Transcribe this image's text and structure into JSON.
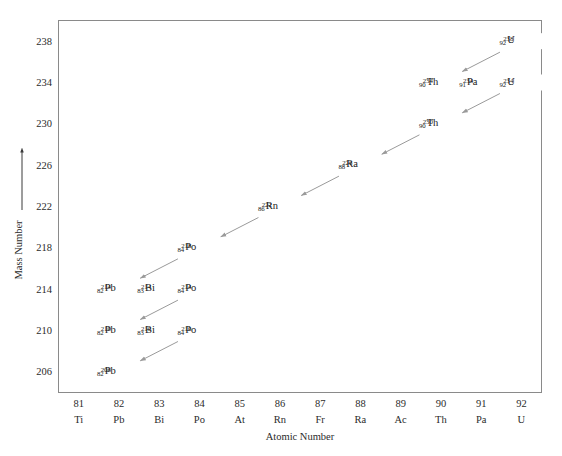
{
  "figure": {
    "title": "",
    "background_color": "#ffffff"
  },
  "axes": {
    "x_title": "Atomic Number",
    "y_title": "Mass Number",
    "y_axis_arrow": "up-arrow",
    "grid": "on",
    "grid_color": "#e3e3e3",
    "frame_color": "#8a8a8a"
  },
  "chart_data": {
    "type": "scatter",
    "title": "",
    "xlabel": "Atomic Number",
    "ylabel": "Mass Number",
    "xlim": [
      80.5,
      92.5
    ],
    "ylim": [
      204,
      240
    ],
    "grid": true,
    "legend": "none",
    "x_ticks": [
      {
        "number": "81",
        "symbol": "Ti"
      },
      {
        "number": "82",
        "symbol": "Pb"
      },
      {
        "number": "83",
        "symbol": "Bi"
      },
      {
        "number": "84",
        "symbol": "Po"
      },
      {
        "number": "85",
        "symbol": "At"
      },
      {
        "number": "86",
        "symbol": "Rn"
      },
      {
        "number": "87",
        "symbol": "Fr"
      },
      {
        "number": "88",
        "symbol": "Ra"
      },
      {
        "number": "89",
        "symbol": "Ac"
      },
      {
        "number": "90",
        "symbol": "Th"
      },
      {
        "number": "91",
        "symbol": "Pa"
      },
      {
        "number": "92",
        "symbol": "U"
      }
    ],
    "y_ticks": [
      "206",
      "210",
      "214",
      "218",
      "222",
      "226",
      "230",
      "234",
      "238"
    ],
    "nuclides": [
      {
        "id": "U238",
        "mass": "238",
        "z": "92",
        "symbol": "U",
        "x": 92,
        "y": 238
      },
      {
        "id": "Th234",
        "mass": "234",
        "z": "90",
        "symbol": "Th",
        "x": 90,
        "y": 234
      },
      {
        "id": "Pa234",
        "mass": "234",
        "z": "91",
        "symbol": "Pa",
        "x": 91,
        "y": 234
      },
      {
        "id": "U234",
        "mass": "234",
        "z": "92",
        "symbol": "U",
        "x": 92,
        "y": 234
      },
      {
        "id": "Th230",
        "mass": "230",
        "z": "90",
        "symbol": "Th",
        "x": 90,
        "y": 230
      },
      {
        "id": "Ra226",
        "mass": "226",
        "z": "88",
        "symbol": "Ra",
        "x": 88,
        "y": 226
      },
      {
        "id": "Rn222",
        "mass": "222",
        "z": "86",
        "symbol": "Rn",
        "x": 86,
        "y": 222
      },
      {
        "id": "Po218",
        "mass": "218",
        "z": "84",
        "symbol": "Po",
        "x": 84,
        "y": 218
      },
      {
        "id": "Pb214",
        "mass": "214",
        "z": "82",
        "symbol": "Pb",
        "x": 82,
        "y": 214
      },
      {
        "id": "Bi214",
        "mass": "214",
        "z": "83",
        "symbol": "Bi",
        "x": 83,
        "y": 214
      },
      {
        "id": "Po214",
        "mass": "214",
        "z": "84",
        "symbol": "Po",
        "x": 84,
        "y": 214
      },
      {
        "id": "Pb210",
        "mass": "210",
        "z": "82",
        "symbol": "Pb",
        "x": 82,
        "y": 210
      },
      {
        "id": "Bi210",
        "mass": "210",
        "z": "83",
        "symbol": "Bi",
        "x": 83,
        "y": 210
      },
      {
        "id": "Po210",
        "mass": "210",
        "z": "84",
        "symbol": "Po",
        "x": 84,
        "y": 210
      },
      {
        "id": "Pb206",
        "mass": "206",
        "z": "82",
        "symbol": "Pb",
        "x": 82,
        "y": 206
      }
    ],
    "decays": [
      {
        "from": "U238",
        "to": "Th234",
        "type": "alpha",
        "color": "#9a9a9a"
      },
      {
        "from": "Th234",
        "to": "Pa234",
        "type": "beta",
        "color": "#111111"
      },
      {
        "from": "Pa234",
        "to": "U234",
        "type": "beta",
        "color": "#111111"
      },
      {
        "from": "U234",
        "to": "Th230",
        "type": "alpha",
        "color": "#9a9a9a"
      },
      {
        "from": "Th230",
        "to": "Ra226",
        "type": "alpha",
        "color": "#9a9a9a"
      },
      {
        "from": "Ra226",
        "to": "Rn222",
        "type": "alpha",
        "color": "#9a9a9a"
      },
      {
        "from": "Rn222",
        "to": "Po218",
        "type": "alpha",
        "color": "#9a9a9a"
      },
      {
        "from": "Po218",
        "to": "Pb214",
        "type": "alpha",
        "color": "#9a9a9a"
      },
      {
        "from": "Pb214",
        "to": "Bi214",
        "type": "beta",
        "color": "#111111"
      },
      {
        "from": "Bi214",
        "to": "Po214",
        "type": "beta",
        "color": "#111111"
      },
      {
        "from": "Po214",
        "to": "Pb210",
        "type": "alpha",
        "color": "#9a9a9a"
      },
      {
        "from": "Pb210",
        "to": "Bi210",
        "type": "beta",
        "color": "#111111"
      },
      {
        "from": "Bi210",
        "to": "Po210",
        "type": "beta",
        "color": "#111111"
      },
      {
        "from": "Po210",
        "to": "Pb206",
        "type": "alpha",
        "color": "#9a9a9a"
      }
    ]
  }
}
